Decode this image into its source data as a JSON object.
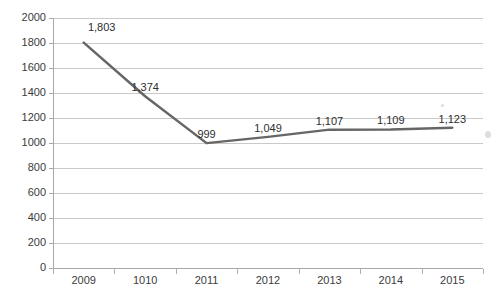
{
  "chart_data": {
    "type": "line",
    "title": "",
    "subtitle": "",
    "xlabel": "",
    "ylabel": "",
    "categories": [
      "2009",
      "1010",
      "2011",
      "2012",
      "2013",
      "2014",
      "2015"
    ],
    "values": [
      1803,
      1374,
      999,
      1049,
      1107,
      1109,
      1123
    ],
    "point_labels": [
      "1,803",
      "1,374",
      "999",
      "1,049",
      "1,107",
      "1,109",
      "1,123"
    ],
    "series": [
      {
        "name": "",
        "values": [
          1803,
          1374,
          999,
          1049,
          1107,
          1109,
          1123
        ],
        "color": "#666666"
      }
    ],
    "ylim": [
      0,
      2000
    ],
    "y_ticks": [
      0,
      200,
      400,
      600,
      800,
      1000,
      1200,
      1400,
      1600,
      1800,
      2000
    ],
    "y_tick_labels": [
      "0",
      "200",
      "400",
      "600",
      "800",
      "1000",
      "1200",
      "1400",
      "1600",
      "1800",
      "2000"
    ],
    "grid": "horizontal",
    "legend": "none",
    "markers": false,
    "line_width": 2.5,
    "colors": {
      "line": "#666666",
      "grid": "#c9c9c9",
      "axis": "#a8a8a8",
      "text": "#3b3b3b",
      "background": "#ffffff"
    }
  }
}
